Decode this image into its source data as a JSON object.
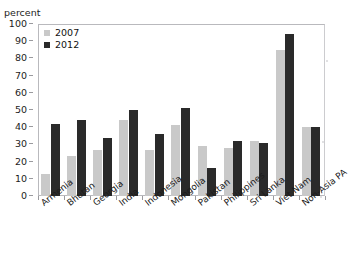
{
  "chart_data": {
    "type": "bar",
    "title": "",
    "xlabel": "",
    "ylabel": "percent",
    "ylim": [
      0,
      100
    ],
    "yticks": [
      0,
      10,
      20,
      30,
      40,
      50,
      60,
      70,
      80,
      90,
      100
    ],
    "grid": false,
    "legend_position": "top-left",
    "categories": [
      "Armenia",
      "Bhutan",
      "Georgia",
      "India",
      "Indonesia",
      "Mongolia",
      "Pakistan",
      "Philippines",
      "Sri Lanka",
      "Viet Nam",
      "Non-Asia PA"
    ],
    "series": [
      {
        "name": "2007",
        "color": "#c9c9c9",
        "values": [
          13,
          23,
          27,
          44,
          27,
          41,
          29,
          28,
          32,
          85,
          40
        ]
      },
      {
        "name": "2012",
        "color": "#2a2a2a",
        "values": [
          42,
          44,
          34,
          50,
          36,
          51,
          16,
          32,
          31,
          94,
          40
        ]
      }
    ]
  },
  "axis": {
    "unit_label": "percent"
  },
  "legend": {
    "items": [
      {
        "label": "2007",
        "swatch": "#c9c9c9"
      },
      {
        "label": "2012",
        "swatch": "#2a2a2a"
      }
    ]
  }
}
